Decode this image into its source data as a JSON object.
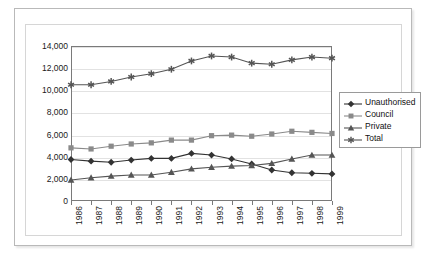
{
  "chart_data": {
    "type": "line",
    "title": "",
    "xlabel": "",
    "ylabel": "",
    "categories": [
      "1986",
      "1987",
      "1988",
      "1989",
      "1990",
      "1991",
      "1992",
      "1993",
      "1994",
      "1995",
      "1996",
      "1997",
      "1998",
      "1999"
    ],
    "ylim": [
      0,
      14000
    ],
    "yticks": [
      0,
      2000,
      4000,
      6000,
      8000,
      10000,
      12000,
      14000
    ],
    "ytick_labels": [
      "0",
      "2,000",
      "4,000",
      "6,000",
      "8,000",
      "10,000",
      "12,000",
      "14,000"
    ],
    "grid": true,
    "legend_position": "right",
    "series": [
      {
        "name": "Unauthorised",
        "marker": "diamond",
        "color": "#333333",
        "values": [
          3750,
          3600,
          3500,
          3700,
          3850,
          3850,
          4300,
          4150,
          3800,
          3350,
          2800,
          2550,
          2500,
          2450
        ]
      },
      {
        "name": "Council",
        "marker": "square",
        "color": "#8a8a8a",
        "values": [
          4800,
          4700,
          4950,
          5150,
          5250,
          5500,
          5500,
          5900,
          5950,
          5850,
          6050,
          6300,
          6200,
          6100
        ]
      },
      {
        "name": "Private",
        "marker": "triangle",
        "color": "#555555",
        "values": [
          1900,
          2100,
          2250,
          2350,
          2350,
          2600,
          2900,
          3050,
          3150,
          3200,
          3400,
          3800,
          4150,
          4150
        ]
      },
      {
        "name": "Total",
        "marker": "asterisk",
        "color": "#555555",
        "values": [
          10500,
          10500,
          10800,
          11200,
          11500,
          11900,
          12650,
          13100,
          13000,
          12450,
          12350,
          12750,
          13000,
          12900
        ]
      }
    ]
  },
  "colors": {
    "plot_border": "#7a7a7a",
    "gridline": "#e2e2e2",
    "outer_frame": "#b9b9b9",
    "panel_border": "#d6d6d6",
    "background": "#ffffff",
    "text": "#1a1a1a"
  }
}
